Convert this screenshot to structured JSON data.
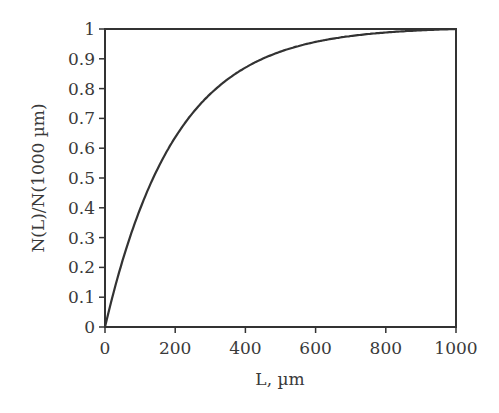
{
  "chart_data": {
    "type": "line",
    "title": "",
    "xlabel": "L, µm",
    "ylabel": "N(L)/N(1000 µm)",
    "xlim": [
      0,
      1000
    ],
    "ylim": [
      0,
      1
    ],
    "xticks": [
      0,
      200,
      400,
      600,
      800,
      1000
    ],
    "yticks": [
      0,
      0.1,
      0.2,
      0.3,
      0.4,
      0.5,
      0.6,
      0.7,
      0.8,
      0.9,
      1
    ],
    "ytick_labels": [
      "0",
      "0.1",
      "0.2",
      "0.3",
      "0.4",
      "0.5",
      "0.6",
      "0.7",
      "0.8",
      "0.9",
      "1"
    ],
    "grid": false,
    "legend": null,
    "series": [
      {
        "name": "N(L)/N(1000 µm)",
        "x": [
          0,
          50,
          100,
          150,
          200,
          250,
          300,
          350,
          400,
          450,
          500,
          600,
          700,
          800,
          900,
          1000
        ],
        "values": [
          0,
          0.22,
          0.4,
          0.53,
          0.64,
          0.72,
          0.78,
          0.83,
          0.865,
          0.895,
          0.92,
          0.95,
          0.97,
          0.98,
          0.99,
          0.995
        ]
      }
    ],
    "line_color": "#333333"
  }
}
